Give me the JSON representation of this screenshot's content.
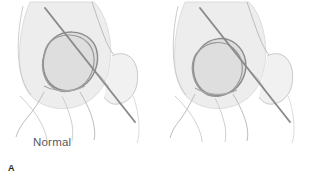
{
  "figure": {
    "name": "klein-line-hip-radiograph-comparison",
    "background_color": "#ffffff",
    "width": 309,
    "height": 182
  },
  "style": {
    "bone_fill": "#ededed",
    "bone_fill_light": "#f4f4f4",
    "epiphysis_fill": "#dcdcdc",
    "outline_color": "#b9b9b9",
    "outline_color_dark": "#8d8d8f",
    "klein_line_color": "#8a8a8e",
    "caption_color": "#59595c",
    "letter_color": "#2b2b2d"
  },
  "panels": [
    {
      "id": "a",
      "letter": "A",
      "caption": "Normal",
      "description": "Normal hip: Klein line along superior femoral neck intersects the capital femoral epiphysis",
      "klein_line": {
        "x1": 45,
        "y1": 8,
        "x2": 135,
        "y2": 122
      },
      "epiphysis": {
        "cx": 70,
        "cy": 62,
        "rx": 27,
        "ry": 22,
        "rotation": -38
      },
      "intersects_epiphysis": true
    },
    {
      "id": "b",
      "letter": "B",
      "caption": "Slip",
      "description": "Slipped capital femoral epiphysis: Klein line passes superior to the epiphysis without intersecting it",
      "klein_line": {
        "x1": 45,
        "y1": 8,
        "x2": 135,
        "y2": 122
      },
      "epiphysis": {
        "cx": 64,
        "cy": 66,
        "rx": 26,
        "ry": 22,
        "rotation": -52
      },
      "intersects_epiphysis": false
    }
  ]
}
